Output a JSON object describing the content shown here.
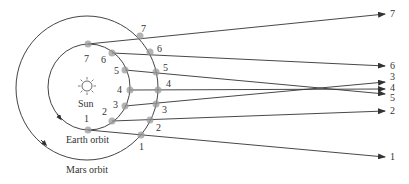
{
  "diagram": {
    "labels": {
      "sun": "Sun",
      "earth_orbit": "Earth orbit",
      "mars_orbit": "Mars orbit"
    },
    "earth_positions": [
      {
        "n": "1",
        "x": 88,
        "y": 130,
        "lx": 84,
        "ly": 122
      },
      {
        "n": "2",
        "x": 112,
        "y": 121,
        "lx": 102,
        "ly": 115
      },
      {
        "n": "3",
        "x": 125,
        "y": 106,
        "lx": 113,
        "ly": 108
      },
      {
        "n": "4",
        "x": 130,
        "y": 90,
        "lx": 117,
        "ly": 93
      },
      {
        "n": "5",
        "x": 125,
        "y": 70,
        "lx": 114,
        "ly": 74
      },
      {
        "n": "6",
        "x": 112,
        "y": 53,
        "lx": 101,
        "ly": 63
      },
      {
        "n": "7",
        "x": 88,
        "y": 44,
        "lx": 84,
        "ly": 62
      }
    ],
    "mars_positions": [
      {
        "n": "1",
        "x": 141,
        "y": 135,
        "lx": 139,
        "ly": 150
      },
      {
        "n": "2",
        "x": 150,
        "y": 120,
        "lx": 156,
        "ly": 131
      },
      {
        "n": "3",
        "x": 156,
        "y": 104,
        "lx": 162,
        "ly": 113
      },
      {
        "n": "4",
        "x": 158,
        "y": 90,
        "lx": 166,
        "ly": 87
      },
      {
        "n": "5",
        "x": 156,
        "y": 72,
        "lx": 163,
        "ly": 71
      },
      {
        "n": "6",
        "x": 150,
        "y": 52,
        "lx": 157,
        "ly": 52
      },
      {
        "n": "7",
        "x": 140,
        "y": 36,
        "lx": 141,
        "ly": 32
      }
    ],
    "apparent_positions": [
      {
        "n": "1",
        "x": 385,
        "y": 157
      },
      {
        "n": "2",
        "x": 385,
        "y": 111
      },
      {
        "n": "3",
        "x": 385,
        "y": 82
      },
      {
        "n": "4",
        "x": 385,
        "y": 89
      },
      {
        "n": "5",
        "x": 385,
        "y": 94
      },
      {
        "n": "6",
        "x": 385,
        "y": 66
      },
      {
        "n": "7",
        "x": 385,
        "y": 14
      }
    ],
    "apparent_label_offsets": {
      "1": 160,
      "2": 114,
      "3": 80,
      "4": 91,
      "5": 101,
      "6": 69,
      "7": 17
    },
    "colors": {
      "line": "#333333",
      "marker": "#999999",
      "background": "#ffffff"
    }
  }
}
